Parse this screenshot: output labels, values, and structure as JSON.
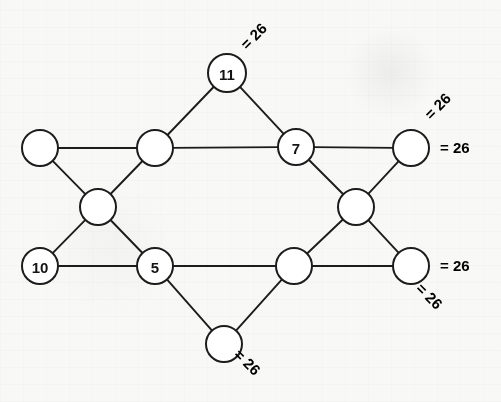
{
  "figure": {
    "type": "magic-graph-puzzle",
    "background_color": "#f8f8f6",
    "ink_color": "#1c1c1c",
    "width": 501,
    "height": 402
  },
  "nodes": [
    {
      "id": "n-top",
      "name": "node-top-11",
      "label": "11",
      "filled": true,
      "cx": 227,
      "cy": 73,
      "r": 19
    },
    {
      "id": "n-left",
      "name": "node-left-empty",
      "label": "",
      "filled": false,
      "cx": 40,
      "cy": 148,
      "r": 18
    },
    {
      "id": "n-upper-mid-left",
      "name": "node-upper-mid-left",
      "label": "",
      "filled": false,
      "cx": 155,
      "cy": 148,
      "r": 18
    },
    {
      "id": "n-seven",
      "name": "node-upper-right-7",
      "label": "7",
      "filled": true,
      "cx": 296,
      "cy": 147,
      "r": 18
    },
    {
      "id": "n-top-right",
      "name": "node-top-right-empty",
      "label": "",
      "filled": false,
      "cx": 411,
      "cy": 148,
      "r": 18
    },
    {
      "id": "n-mid-left",
      "name": "node-center-left",
      "label": "",
      "filled": false,
      "cx": 98,
      "cy": 207,
      "r": 18
    },
    {
      "id": "n-mid-right",
      "name": "node-center-right",
      "label": "",
      "filled": false,
      "cx": 356,
      "cy": 207,
      "r": 18
    },
    {
      "id": "n-ten",
      "name": "node-lower-left-10",
      "label": "10",
      "filled": true,
      "cx": 40,
      "cy": 266,
      "r": 18
    },
    {
      "id": "n-five",
      "name": "node-lower-mid-left-5",
      "label": "5",
      "filled": true,
      "cx": 155,
      "cy": 266,
      "r": 18
    },
    {
      "id": "n-lower-mid",
      "name": "node-lower-mid-right",
      "label": "",
      "filled": false,
      "cx": 294,
      "cy": 266,
      "r": 18
    },
    {
      "id": "n-bottom-right",
      "name": "node-bottom-right-empty",
      "label": "",
      "filled": false,
      "cx": 411,
      "cy": 266,
      "r": 18
    },
    {
      "id": "n-bottom",
      "name": "node-bottom-empty",
      "label": "",
      "filled": false,
      "cx": 224,
      "cy": 344,
      "r": 18
    }
  ],
  "edges": [
    {
      "name": "edge-top-to-upper-mid-left",
      "from": "n-top",
      "to": "n-upper-mid-left"
    },
    {
      "name": "edge-top-to-seven",
      "from": "n-top",
      "to": "n-seven"
    },
    {
      "name": "edge-left-to-upper-mid",
      "from": "n-left",
      "to": "n-upper-mid-left"
    },
    {
      "name": "edge-upper-mid-to-seven",
      "from": "n-upper-mid-left",
      "to": "n-seven"
    },
    {
      "name": "edge-seven-to-top-right",
      "from": "n-seven",
      "to": "n-top-right"
    },
    {
      "name": "edge-left-to-center-left",
      "from": "n-left",
      "to": "n-mid-left"
    },
    {
      "name": "edge-center-left-to-upper",
      "from": "n-mid-left",
      "to": "n-upper-mid-left"
    },
    {
      "name": "edge-center-left-to-ten",
      "from": "n-mid-left",
      "to": "n-ten"
    },
    {
      "name": "edge-center-left-to-five",
      "from": "n-mid-left",
      "to": "n-five"
    },
    {
      "name": "edge-ten-to-five",
      "from": "n-ten",
      "to": "n-five"
    },
    {
      "name": "edge-five-to-lower-mid",
      "from": "n-five",
      "to": "n-lower-mid"
    },
    {
      "name": "edge-five-to-bottom",
      "from": "n-five",
      "to": "n-bottom"
    },
    {
      "name": "edge-bottom-to-lower-mid",
      "from": "n-bottom",
      "to": "n-lower-mid"
    },
    {
      "name": "edge-lower-mid-to-center-r",
      "from": "n-lower-mid",
      "to": "n-mid-right"
    },
    {
      "name": "edge-center-right-to-seven",
      "from": "n-mid-right",
      "to": "n-seven"
    },
    {
      "name": "edge-center-right-to-topr",
      "from": "n-mid-right",
      "to": "n-top-right"
    },
    {
      "name": "edge-center-right-to-botr",
      "from": "n-mid-right",
      "to": "n-bottom-right"
    },
    {
      "name": "edge-lower-mid-to-bottom-r",
      "from": "n-lower-mid",
      "to": "n-bottom-right"
    }
  ],
  "sum_labels": [
    {
      "name": "sum-label-top",
      "text": "= 26",
      "x": 243,
      "y": 47,
      "rotate": -45
    },
    {
      "name": "sum-label-upper-right",
      "text": "= 26",
      "x": 427,
      "y": 117,
      "rotate": -45
    },
    {
      "name": "sum-label-right-upper",
      "text": "= 26",
      "x": 440,
      "y": 148,
      "rotate": 0
    },
    {
      "name": "sum-label-right-lower",
      "text": "= 26",
      "x": 440,
      "y": 266,
      "rotate": 0
    },
    {
      "name": "sum-label-bottom-right",
      "text": "= 26",
      "x": 419,
      "y": 286,
      "rotate": 45
    },
    {
      "name": "sum-label-bottom",
      "text": "= 26",
      "x": 237,
      "y": 352,
      "rotate": 45
    }
  ],
  "puzzle": {
    "magic_sum": 26,
    "given_values": [
      "11",
      "7",
      "10",
      "5"
    ],
    "total_nodes": 12,
    "total_lines": 6
  }
}
